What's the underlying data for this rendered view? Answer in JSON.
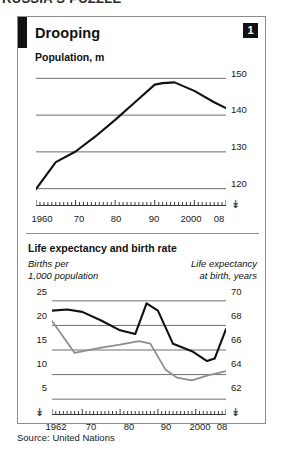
{
  "top_headline": "RUSSIA'S PUZZLE",
  "panel": {
    "title": "Drooping",
    "badge": "1"
  },
  "chart1_subtitle": "Population, m",
  "chart2_subtitle": "Life expectancy and birth rate",
  "chart2_left_caption": "Births per\n1,000 population",
  "chart2_right_caption": "Life expectancy\nat birth, years",
  "source": "Source: United Nations",
  "colors": {
    "line_black": "#111111",
    "line_gray": "#8e8e8e",
    "gridline": "#6f6f6f",
    "border": "#8d8d8d",
    "text": "#1a1a1a"
  },
  "break_symbol": "≈",
  "chart_data": [
    {
      "type": "line",
      "title": "Population, m",
      "xlabel": "",
      "ylabel": "Population, m",
      "grid": true,
      "legend": "none",
      "xlim": [
        1960,
        2008
      ],
      "ylim": [
        118,
        152
      ],
      "yticks": [
        120,
        130,
        140,
        150
      ],
      "xticks": [
        1960,
        1970,
        1980,
        1990,
        2000,
        2008
      ],
      "xtick_labels": [
        "1960",
        "70",
        "80",
        "90",
        "2000",
        "08"
      ],
      "series": [
        {
          "name": "Population",
          "color": "#111111",
          "x": [
            1960,
            1965,
            1970,
            1975,
            1980,
            1985,
            1990,
            1992,
            1995,
            2000,
            2005,
            2008
          ],
          "values": [
            119.9,
            127.2,
            130.1,
            134.2,
            138.7,
            143.5,
            148.3,
            148.7,
            148.9,
            146.6,
            143.5,
            141.9
          ]
        }
      ]
    },
    {
      "type": "line",
      "title": "Life expectancy and birth rate",
      "grid": true,
      "legend": "none",
      "xlim": [
        1962,
        2008
      ],
      "xticks": [
        1962,
        1970,
        1980,
        1990,
        2000,
        2008
      ],
      "xtick_labels": [
        "1962",
        "70",
        "80",
        "90",
        "2000",
        "08"
      ],
      "left_axis": {
        "label": "Births per 1,000 population",
        "ylim": [
          3,
          27
        ],
        "yticks": [
          5,
          10,
          15,
          20,
          25
        ]
      },
      "right_axis": {
        "label": "Life expectancy at birth, years",
        "ylim": [
          61.2,
          70.8
        ],
        "yticks": [
          62,
          64,
          66,
          68,
          70
        ]
      },
      "series": [
        {
          "name": "Life expectancy at birth, years",
          "axis": "right",
          "color": "#111111",
          "x": [
            1962,
            1966,
            1970,
            1975,
            1980,
            1984,
            1987,
            1990,
            1994,
            1999,
            2003,
            2005,
            2008
          ],
          "values": [
            69.2,
            69.3,
            69.1,
            68.4,
            67.6,
            67.3,
            69.8,
            69.2,
            66.5,
            65.9,
            65.1,
            65.3,
            67.7
          ]
        },
        {
          "name": "Births per 1,000 population",
          "axis": "left",
          "color": "#8e8e8e",
          "x": [
            1962,
            1968,
            1975,
            1980,
            1985,
            1988,
            1992,
            1995,
            1999,
            2003,
            2008
          ],
          "values": [
            20.9,
            14.4,
            15.5,
            16.1,
            16.8,
            16.3,
            11.0,
            9.4,
            8.8,
            9.8,
            10.7
          ]
        }
      ]
    }
  ]
}
